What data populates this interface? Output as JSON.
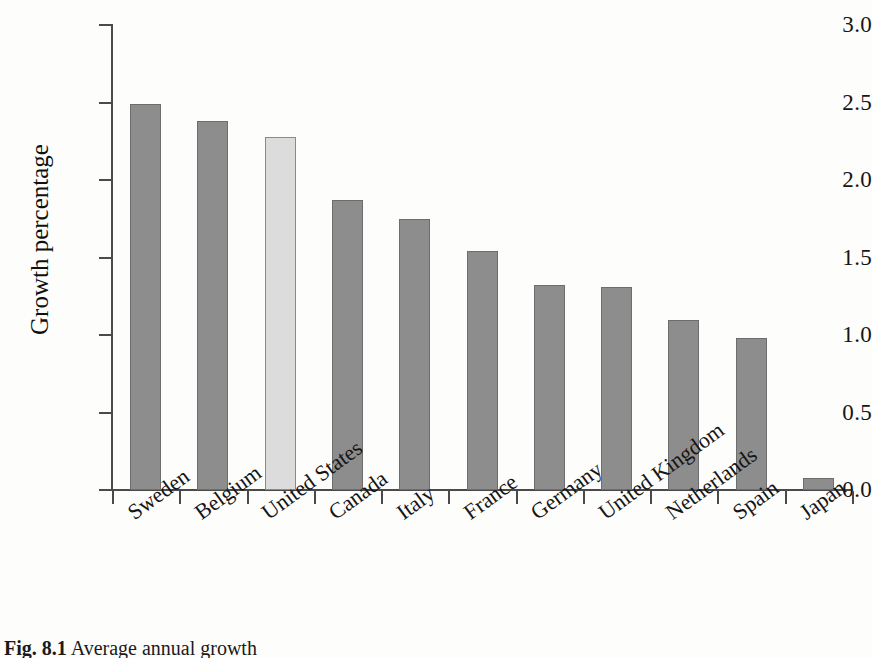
{
  "figure": {
    "caption_label": "Fig. 8.1",
    "caption_text": "Average annual growth"
  },
  "chart_data": {
    "type": "bar",
    "title": "",
    "xlabel": "",
    "ylabel": "Growth percentage",
    "ylim": [
      0.0,
      3.0
    ],
    "ytick_labels": [
      "0.0",
      "0.5",
      "1.0",
      "1.5",
      "2.0",
      "2.5",
      "3.0"
    ],
    "ytick_values": [
      0.0,
      0.5,
      1.0,
      1.5,
      2.0,
      2.5,
      3.0
    ],
    "grid": false,
    "legend": "none",
    "highlight_category": "United States",
    "colors": {
      "bar": "#8d8d8d",
      "bar_border": "#6d6d6d",
      "bar_highlight": "#dcdcdc",
      "bar_highlight_border": "#8a8a8a",
      "axis": "#4a4a4a",
      "background": "#fdfdfc",
      "text": "#151515"
    },
    "categories": [
      "Sweden",
      "Belgium",
      "United States",
      "Canada",
      "Italy",
      "France",
      "Germany",
      "United Kingdom",
      "Netherlands",
      "Spain",
      "Japan"
    ],
    "values": [
      2.49,
      2.38,
      2.28,
      1.87,
      1.75,
      1.54,
      1.32,
      1.31,
      1.1,
      0.98,
      0.08
    ]
  }
}
